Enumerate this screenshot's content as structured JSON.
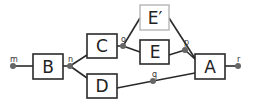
{
  "diagram": {
    "title": "",
    "colors": {
      "edge": "#2a2a2a",
      "box_border": "#2a2a2a",
      "box_border_faded": "#b5b5b5",
      "port_dot": "#666666",
      "background": "#ffffff"
    },
    "boxes": [
      {
        "id": "B",
        "label": "B",
        "x": 33,
        "y": 54,
        "w": 30,
        "h": 25,
        "faded": false
      },
      {
        "id": "C",
        "label": "C",
        "x": 87,
        "y": 34,
        "w": 30,
        "h": 24,
        "faded": false
      },
      {
        "id": "D",
        "label": "D",
        "x": 87,
        "y": 74,
        "w": 30,
        "h": 24,
        "faded": false
      },
      {
        "id": "E_prime",
        "label": "E′",
        "x": 140,
        "y": 5,
        "w": 29,
        "h": 25,
        "faded": true
      },
      {
        "id": "E",
        "label": "E",
        "x": 140,
        "y": 40,
        "w": 29,
        "h": 24,
        "faded": false
      },
      {
        "id": "A",
        "label": "A",
        "x": 195,
        "y": 54,
        "w": 30,
        "h": 25,
        "faded": false
      }
    ],
    "ports": [
      {
        "id": "m",
        "label": "m",
        "x": 13,
        "y": 66
      },
      {
        "id": "n",
        "label": "n",
        "x": 70,
        "y": 66
      },
      {
        "id": "o",
        "label": "o",
        "x": 123,
        "y": 46
      },
      {
        "id": "p",
        "label": "p",
        "x": 185,
        "y": 50
      },
      {
        "id": "q",
        "label": "q",
        "x": 153,
        "y": 81
      },
      {
        "id": "r",
        "label": "r",
        "x": 238,
        "y": 66
      }
    ],
    "edges": [
      {
        "from": "m",
        "to": "B"
      },
      {
        "from": "B",
        "to": "n"
      },
      {
        "from": "n",
        "to": "C"
      },
      {
        "from": "n",
        "to": "D"
      },
      {
        "from": "C",
        "to": "o"
      },
      {
        "from": "o",
        "to": "E_prime"
      },
      {
        "from": "o",
        "to": "E"
      },
      {
        "from": "E",
        "to": "p"
      },
      {
        "from": "E_prime",
        "to": "A"
      },
      {
        "from": "p",
        "to": "A"
      },
      {
        "from": "D",
        "to": "q"
      },
      {
        "from": "q",
        "to": "A"
      },
      {
        "from": "A",
        "to": "r"
      }
    ]
  }
}
